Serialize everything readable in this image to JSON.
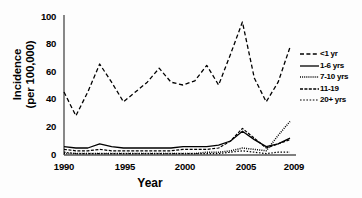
{
  "chart_data": {
    "type": "line",
    "title": "",
    "xlabel": "Year",
    "ylabel_line1": "Incidence",
    "ylabel_line2": "(per 100,000)",
    "xlim": [
      1990,
      2009
    ],
    "ylim": [
      0,
      100
    ],
    "grid": false,
    "legend_position": "right",
    "yticks": [
      0,
      20,
      40,
      60,
      80,
      100
    ],
    "xticks": [
      1990,
      1995,
      2000,
      2005,
      2009
    ],
    "x": [
      1990,
      1991,
      1992,
      1993,
      1994,
      1995,
      1996,
      1997,
      1998,
      1999,
      2000,
      2001,
      2002,
      2003,
      2004,
      2005,
      2006,
      2007,
      2008,
      2009
    ],
    "series": [
      {
        "name": "<1 yr",
        "style": "dashed",
        "values": [
          45,
          28,
          45,
          65,
          52,
          38,
          45,
          52,
          62,
          52,
          50,
          53,
          64,
          50,
          72,
          95,
          55,
          38,
          52,
          77
        ]
      },
      {
        "name": "1-6 yrs",
        "style": "solid",
        "values": [
          6,
          5,
          5,
          8,
          6,
          5,
          5,
          5,
          5,
          5,
          6,
          6,
          6,
          7,
          10,
          17,
          11,
          6,
          8,
          12
        ]
      },
      {
        "name": "7-10 yrs",
        "style": "dotted",
        "values": [
          1,
          1,
          1,
          1,
          1,
          1,
          1,
          1,
          1,
          1,
          1,
          1,
          2,
          2,
          3,
          5,
          4,
          3,
          14,
          24
        ]
      },
      {
        "name": "11-19",
        "style": "dashdot",
        "values": [
          4,
          3,
          3,
          4,
          3,
          3,
          3,
          3,
          3,
          3,
          4,
          4,
          4,
          5,
          10,
          19,
          12,
          5,
          8,
          11
        ]
      },
      {
        "name": "20+ yrs",
        "style": "finedot",
        "values": [
          2,
          1,
          1,
          1,
          1,
          1,
          1,
          1,
          1,
          1,
          1,
          1,
          1,
          1,
          2,
          3,
          2,
          1,
          2,
          2
        ]
      }
    ]
  }
}
